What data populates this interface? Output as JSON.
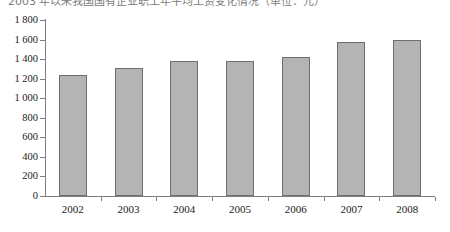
{
  "caption": {
    "sliver_text": "2003 年以来我国国有企业职工年平均工资变化情况（单位：元）"
  },
  "chart_data": {
    "type": "bar",
    "title": "",
    "xlabel": "",
    "ylabel": "",
    "categories": [
      "2002",
      "2003",
      "2004",
      "2005",
      "2006",
      "2007",
      "2008"
    ],
    "values": [
      1240,
      1310,
      1380,
      1380,
      1420,
      1570,
      1600
    ],
    "ylim": [
      0,
      1800
    ],
    "ytick_step": 200,
    "ytick_labels": [
      "0",
      "200",
      "400",
      "600",
      "800",
      "1 000",
      "1 200",
      "1 400",
      "1 600",
      "1 800"
    ],
    "ytick_values": [
      0,
      200,
      400,
      600,
      800,
      1000,
      1200,
      1400,
      1600,
      1800
    ],
    "grid": false,
    "legend": false,
    "bar_color": "#b4b4b4",
    "bar_border_color": "#6e6e6e",
    "axis_color": "#7d7d7d",
    "background": "#ffffff"
  }
}
